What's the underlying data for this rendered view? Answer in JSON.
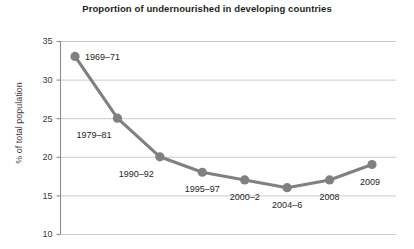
{
  "chart_data": {
    "type": "line",
    "title": "Proportion of undernourished in developing countries",
    "xlabel": "",
    "ylabel": "% of total population",
    "ylim": [
      10,
      35
    ],
    "yticks": [
      10,
      15,
      20,
      25,
      30,
      35
    ],
    "grid": true,
    "legend": "none",
    "series_color": "#808080",
    "categories": [
      "1969–71",
      "1979–81",
      "1990–92",
      "1995–97",
      "2000–2",
      "2004–6",
      "2008",
      "2009"
    ],
    "values": [
      33,
      25,
      20,
      18,
      17,
      16,
      17,
      19
    ],
    "point_labels": [
      {
        "label": "1969–71",
        "value": 33,
        "position": "right"
      },
      {
        "label": "1979–81",
        "value": 25,
        "position": "below-left"
      },
      {
        "label": "1990–92",
        "value": 20,
        "position": "below-left"
      },
      {
        "label": "1995–97",
        "value": 18,
        "position": "below"
      },
      {
        "label": "2000–2",
        "value": 17,
        "position": "below"
      },
      {
        "label": "2004–6",
        "value": 16,
        "position": "below"
      },
      {
        "label": "2008",
        "value": 17,
        "position": "below"
      },
      {
        "label": "2009",
        "value": 19,
        "position": "below-right"
      }
    ]
  },
  "axis": {
    "ytick_labels": [
      "35",
      "30",
      "25",
      "20",
      "15",
      "10"
    ],
    "ylabel_text": "% of total population"
  }
}
